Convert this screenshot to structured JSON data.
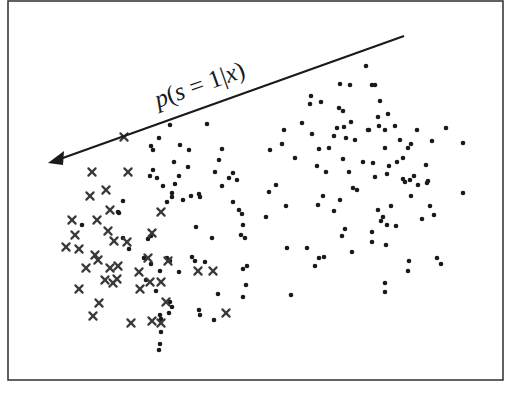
{
  "diagram": {
    "label": {
      "p": "p",
      "open": "(",
      "s": "s",
      "eq": " = 1|",
      "x": 158,
      "close": ")",
      "full_text": "p(s = 1|x)",
      "y": 108,
      "rotate_deg": -19.6
    },
    "arrow": {
      "from": [
        404,
        36
      ],
      "to": [
        48,
        163
      ],
      "color": "#1a1a1a"
    },
    "frame": {
      "x": 8,
      "y": 1,
      "width": 495,
      "height": 379,
      "color": "#3a3a3a"
    },
    "colors": {
      "dot": "#1a1a1a",
      "cross": "#3a3a3a",
      "background": "#ffffff"
    }
  },
  "chart_data": {
    "type": "scatter",
    "title": "",
    "xlabel": "",
    "ylabel": "",
    "annotations": [
      {
        "text": "p(s = 1|x)",
        "kind": "arrow",
        "direction": "toward upper-left / labeled cluster"
      }
    ],
    "legend": [],
    "grid": false,
    "series": [
      {
        "name": "labeled (x markers)",
        "marker": "x",
        "points": [
          [
            124,
            137
          ],
          [
            92,
            172
          ],
          [
            128,
            172
          ],
          [
            106,
            190
          ],
          [
            72,
            220
          ],
          [
            97,
            220
          ],
          [
            110,
            210
          ],
          [
            75,
            235
          ],
          [
            108,
            231
          ],
          [
            66,
            247
          ],
          [
            79,
            249
          ],
          [
            95,
            255
          ],
          [
            98,
            260
          ],
          [
            86,
            268
          ],
          [
            110,
            268
          ],
          [
            118,
            266
          ],
          [
            161,
            212
          ],
          [
            152,
            233
          ],
          [
            127,
            242
          ],
          [
            148,
            258
          ],
          [
            168,
            261
          ],
          [
            139,
            272
          ],
          [
            150,
            282
          ],
          [
            161,
            282
          ],
          [
            105,
            280
          ],
          [
            113,
            283
          ],
          [
            79,
            289
          ],
          [
            198,
            271
          ],
          [
            166,
            302
          ],
          [
            213,
            271
          ],
          [
            99,
            303
          ],
          [
            93,
            316
          ],
          [
            131,
            323
          ],
          [
            152,
            321
          ],
          [
            161,
            323
          ],
          [
            226,
            313
          ],
          [
            140,
            289
          ],
          [
            90,
            196
          ],
          [
            114,
            241
          ],
          [
            117,
            279
          ]
        ]
      },
      {
        "name": "unlabeled (dots)",
        "marker": "dot",
        "points": [
          [
            170,
            125
          ],
          [
            207,
            124
          ],
          [
            159,
            138
          ],
          [
            151,
            146
          ],
          [
            153,
            150
          ],
          [
            180,
            145
          ],
          [
            189,
            150
          ],
          [
            222,
            149
          ],
          [
            174,
            162
          ],
          [
            188,
            167
          ],
          [
            219,
            160
          ],
          [
            153,
            170
          ],
          [
            150,
            176
          ],
          [
            163,
            186
          ],
          [
            179,
            176
          ],
          [
            157,
            178
          ],
          [
            215,
            172
          ],
          [
            191,
            196
          ],
          [
            167,
            202
          ],
          [
            172,
            193
          ],
          [
            172,
            197
          ],
          [
            175,
            184
          ],
          [
            183,
            200
          ],
          [
            199,
            194
          ],
          [
            200,
            197
          ],
          [
            233,
            202
          ],
          [
            222,
            186
          ],
          [
            229,
            178
          ],
          [
            233,
            173
          ],
          [
            239,
            210
          ],
          [
            237,
            180
          ],
          [
            242,
            214
          ],
          [
            243,
            225
          ],
          [
            247,
            266
          ],
          [
            246,
            285
          ],
          [
            243,
            297
          ],
          [
            161,
            332
          ],
          [
            160,
            344
          ],
          [
            118,
            212
          ],
          [
            123,
            201
          ],
          [
            119,
            213
          ],
          [
            82,
            225
          ],
          [
            160,
            315
          ],
          [
            161,
            319
          ],
          [
            159,
            350
          ],
          [
            146,
            280
          ],
          [
            156,
            291
          ],
          [
            170,
            302
          ],
          [
            172,
            307
          ],
          [
            169,
            313
          ],
          [
            200,
            315
          ],
          [
            218,
            294
          ],
          [
            214,
            320
          ],
          [
            199,
            310
          ],
          [
            241,
            235
          ],
          [
            245,
            238
          ],
          [
            195,
            261
          ],
          [
            205,
            262
          ],
          [
            196,
            227
          ],
          [
            212,
            238
          ],
          [
            243,
            269
          ],
          [
            151,
            264
          ],
          [
            123,
            238
          ],
          [
            160,
            271
          ],
          [
            144,
            258
          ],
          [
            167,
            258
          ],
          [
            179,
            272
          ],
          [
            170,
            261
          ],
          [
            129,
            249
          ],
          [
            151,
            236
          ],
          [
            148,
            239
          ],
          [
            192,
            257
          ],
          [
            270,
            150
          ],
          [
            282,
            144
          ],
          [
            284,
            130
          ],
          [
            302,
            123
          ],
          [
            311,
            96
          ],
          [
            310,
            104
          ],
          [
            321,
            102
          ],
          [
            340,
            84
          ],
          [
            339,
            108
          ],
          [
            343,
            111
          ],
          [
            351,
            122
          ],
          [
            350,
            85
          ],
          [
            366,
            66
          ],
          [
            372,
            85
          ],
          [
            380,
            101
          ],
          [
            375,
            85
          ],
          [
            388,
            114
          ],
          [
            378,
            117
          ],
          [
            385,
            130
          ],
          [
            295,
            158
          ],
          [
            312,
            134
          ],
          [
            319,
            149
          ],
          [
            329,
            148
          ],
          [
            334,
            136
          ],
          [
            337,
            128
          ],
          [
            344,
            127
          ],
          [
            343,
            159
          ],
          [
            346,
            138
          ],
          [
            349,
            172
          ],
          [
            355,
            140
          ],
          [
            363,
            162
          ],
          [
            368,
            130
          ],
          [
            373,
            163
          ],
          [
            385,
            148
          ],
          [
            387,
            174
          ],
          [
            400,
            140
          ],
          [
            395,
            126
          ],
          [
            411,
            144
          ],
          [
            397,
            162
          ],
          [
            403,
            158
          ],
          [
            408,
            148
          ],
          [
            417,
            130
          ],
          [
            432,
            141
          ],
          [
            446,
            128
          ],
          [
            414,
            176
          ],
          [
            427,
            183
          ],
          [
            430,
            206
          ],
          [
            403,
            179
          ],
          [
            410,
            180
          ],
          [
            418,
            185
          ],
          [
            428,
            181
          ],
          [
            434,
            215
          ],
          [
            437,
            258
          ],
          [
            441,
            264
          ],
          [
            463,
            193
          ],
          [
            463,
            143
          ],
          [
            369,
            130
          ],
          [
            379,
            126
          ],
          [
            326,
            172
          ],
          [
            323,
            196
          ],
          [
            318,
            205
          ],
          [
            340,
            200
          ],
          [
            334,
            211
          ],
          [
            353,
            188
          ],
          [
            357,
            190
          ],
          [
            375,
            177
          ],
          [
            378,
            210
          ],
          [
            383,
            217
          ],
          [
            391,
            206
          ],
          [
            396,
            226
          ],
          [
            405,
            182
          ],
          [
            422,
            219
          ],
          [
            411,
            196
          ],
          [
            426,
            165
          ],
          [
            286,
            206
          ],
          [
            266,
            217
          ],
          [
            287,
            248
          ],
          [
            315,
            266
          ],
          [
            307,
            248
          ],
          [
            319,
            258
          ],
          [
            324,
            257
          ],
          [
            342,
            236
          ],
          [
            345,
            229
          ],
          [
            372,
            232
          ],
          [
            387,
            225
          ],
          [
            409,
            261
          ],
          [
            408,
            271
          ],
          [
            385,
            283
          ],
          [
            385,
            292
          ],
          [
            291,
            295
          ],
          [
            352,
            252
          ],
          [
            381,
            221
          ],
          [
            372,
            242
          ],
          [
            386,
            245
          ],
          [
            276,
            185
          ],
          [
            269,
            192
          ],
          [
            389,
            166
          ],
          [
            317,
            166
          ]
        ]
      }
    ]
  }
}
